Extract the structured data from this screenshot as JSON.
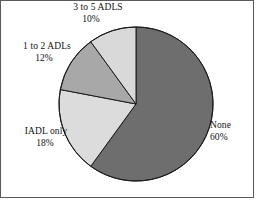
{
  "chart_data": {
    "type": "pie",
    "title": "",
    "subtitle": "",
    "xlabel": "",
    "ylabel": "",
    "legend_position": "none",
    "grid": false,
    "start_angle_deg": 0,
    "direction": "clockwise",
    "categories": [
      "None",
      "IADL only",
      "1 to 2 ADLs",
      "3 to 5 ADLS"
    ],
    "values": [
      60,
      18,
      12,
      10
    ],
    "value_unit": "%",
    "slices": [
      {
        "label": "None",
        "value": 60,
        "value_text": "60%",
        "color": "#6e6e6e",
        "start_deg": 0,
        "end_deg": 216
      },
      {
        "label": "IADL only",
        "value": 18,
        "value_text": "18%",
        "color": "#dcdcdc",
        "start_deg": 216,
        "end_deg": 280.8
      },
      {
        "label": "1 to 2 ADLs",
        "value": 12,
        "value_text": "12%",
        "color": "#a8a8a8",
        "start_deg": 280.8,
        "end_deg": 324
      },
      {
        "label": "3 to 5 ADLS",
        "value": 10,
        "value_text": "10%",
        "color": "#d9d9d9",
        "start_deg": 324,
        "end_deg": 360
      }
    ]
  },
  "labels": {
    "adl35": {
      "name": "3 to 5 ADLS",
      "value": "10%"
    },
    "adl12": {
      "name": "1 to 2 ADLs",
      "value": "12%"
    },
    "iadl": {
      "name": "IADL only",
      "value": "18%"
    },
    "none": {
      "name": "None",
      "value": "60%"
    }
  },
  "style": {
    "outline_color": "#1a1a1a",
    "frame_color": "#5a5a5a",
    "background": "#ffffff",
    "text_color": "#111111"
  },
  "geometry": {
    "center_x": 136,
    "center_y": 104,
    "radius": 77
  }
}
